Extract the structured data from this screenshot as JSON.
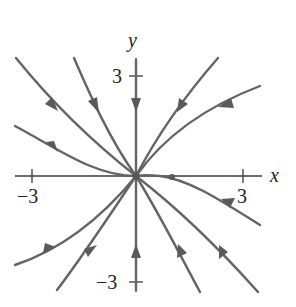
{
  "diagram": {
    "type": "phase-portrait",
    "axes": {
      "x_label": "x",
      "y_label": "y",
      "x_ticks": [
        {
          "value": -3,
          "label": "−3"
        },
        {
          "value": 3,
          "label": "3"
        }
      ],
      "y_ticks": [
        {
          "value": 3,
          "label": "3"
        },
        {
          "value": -3,
          "label": "−3"
        }
      ]
    },
    "equilibrium": {
      "x": 0,
      "y": 0,
      "type": "stable-node"
    },
    "marked_point": {
      "x": 1,
      "y": 0
    },
    "trajectories": [
      {
        "id": "upper-left-outer",
        "direction": "toward-origin"
      },
      {
        "id": "upper-left-inner",
        "direction": "toward-origin"
      },
      {
        "id": "positive-y-axis",
        "direction": "toward-origin"
      },
      {
        "id": "upper-right-inner",
        "direction": "toward-origin"
      },
      {
        "id": "upper-right-outer",
        "direction": "toward-origin"
      },
      {
        "id": "left-tangent",
        "direction": "toward-origin"
      },
      {
        "id": "right-tangent",
        "direction": "toward-origin"
      },
      {
        "id": "lower-left-outer",
        "direction": "toward-origin"
      },
      {
        "id": "lower-left-inner",
        "direction": "toward-origin"
      },
      {
        "id": "negative-y-axis",
        "direction": "toward-origin"
      },
      {
        "id": "lower-right-inner",
        "direction": "toward-origin"
      },
      {
        "id": "lower-right-outer",
        "direction": "toward-origin"
      }
    ],
    "colors": {
      "trajectory": "#646464",
      "axis": "#3a3a3a",
      "background": "#ffffff"
    }
  }
}
